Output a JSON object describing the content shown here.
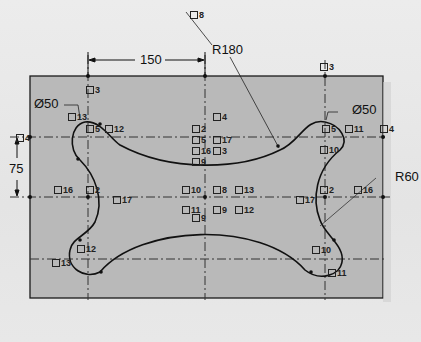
{
  "drawing": {
    "dimensions": {
      "width_150": "150",
      "radius_180": "R180",
      "diameter_left": "Ø50",
      "diameter_right": "Ø50",
      "height_75": "75",
      "radius_60": "R60"
    },
    "relation_tags": [
      {
        "id": "t8_top",
        "text": "8"
      },
      {
        "id": "t3_left",
        "text": "3"
      },
      {
        "id": "t3_right",
        "text": "3"
      },
      {
        "id": "t13_ul",
        "text": "13"
      },
      {
        "id": "t5_ul",
        "text": "5"
      },
      {
        "id": "t12_ul",
        "text": "12"
      },
      {
        "id": "t4_left",
        "text": "4"
      },
      {
        "id": "t16_left",
        "text": "16"
      },
      {
        "id": "t2_left",
        "text": "2"
      },
      {
        "id": "t17_left",
        "text": "17"
      },
      {
        "id": "t4_c",
        "text": "4"
      },
      {
        "id": "t2_c",
        "text": "2"
      },
      {
        "id": "t5_c",
        "text": "5"
      },
      {
        "id": "t17_c",
        "text": "17"
      },
      {
        "id": "t16_c",
        "text": "16"
      },
      {
        "id": "t3_c",
        "text": "3"
      },
      {
        "id": "t9_c",
        "text": "9"
      },
      {
        "id": "t10_c",
        "text": "10"
      },
      {
        "id": "t8_c",
        "text": "8"
      },
      {
        "id": "t13_c",
        "text": "13"
      },
      {
        "id": "t11_c",
        "text": "11"
      },
      {
        "id": "t9_c2",
        "text": "9"
      },
      {
        "id": "t12_c",
        "text": "12"
      },
      {
        "id": "t9_c3",
        "text": "9"
      },
      {
        "id": "t5_ur",
        "text": "5"
      },
      {
        "id": "t11_ur",
        "text": "11"
      },
      {
        "id": "t4_right",
        "text": "4"
      },
      {
        "id": "t10_ur",
        "text": "10"
      },
      {
        "id": "t2_right",
        "text": "2"
      },
      {
        "id": "t17_right",
        "text": "17"
      },
      {
        "id": "t16_right",
        "text": "16"
      },
      {
        "id": "t12_ll",
        "text": "12"
      },
      {
        "id": "t13_ll",
        "text": "13"
      },
      {
        "id": "t10_lr",
        "text": "10"
      },
      {
        "id": "t11_lr",
        "text": "11"
      }
    ]
  },
  "colors": {
    "sheet": "#b9b9b9",
    "line": "#1a1a1a",
    "background": "#e9e9e9"
  }
}
